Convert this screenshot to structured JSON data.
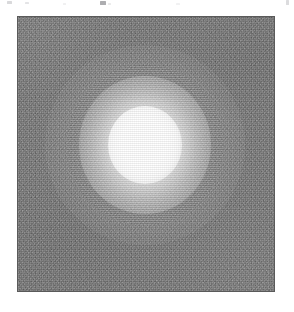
{
  "page": {
    "background_color": "#ffffff",
    "width_px": 294,
    "height_px": 312
  },
  "cropped_header_text": {
    "description": "partial glyph descenders from a line of text cut off above the top edge of the crop",
    "legible_text": ""
  },
  "image_panel": {
    "label": "grayscale image panel",
    "x_px": 18,
    "y_px": 17,
    "width_px": 256,
    "height_px": 274,
    "border_color": "#5a5a5a",
    "background_color": "#7d7d7d"
  },
  "chart_data": {
    "type": "heatmap",
    "title": "",
    "subtitle": "",
    "xlabel": "",
    "ylabel": "",
    "colormap": "grayscale",
    "grid": false,
    "legend": "none",
    "colorbar": false,
    "axis_ticks": false,
    "axis_labels": false,
    "extent_px": {
      "x0": 0,
      "y0": 0,
      "x1": 256,
      "y1": 274
    },
    "background": {
      "mean_level": 122,
      "mean_hex": "#7a7a7a",
      "noise_sigma": 15,
      "min_level": 96,
      "max_level": 150
    },
    "sources": [
      {
        "name": "central-bright-source",
        "center_x_px": 127,
        "center_y_px": 128,
        "peak_level": 255,
        "peak_hex": "#ffffff",
        "saturated": true,
        "core_radius_px": 32,
        "fwhm_px": 58,
        "halo_radius_px": 100,
        "ellipticity": 0.06,
        "shape": "gaussian"
      }
    ],
    "value_range": [
      96,
      255
    ]
  }
}
